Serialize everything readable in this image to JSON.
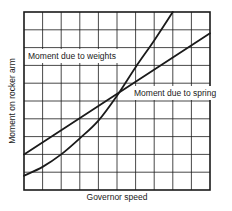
{
  "chart_data": {
    "type": "line",
    "title": "",
    "xlabel": "Governor speed",
    "ylabel": "Moment on rocker arm",
    "xlim": [
      0,
      10
    ],
    "ylim": [
      0,
      10
    ],
    "grid": true,
    "grid_divisions": {
      "x": 10,
      "y": 10
    },
    "tick_labels": false,
    "legend": "inline labels",
    "series": [
      {
        "name": "Moment due to weights",
        "shape": "curve (upward-bending)",
        "x": [
          0,
          1,
          2,
          3,
          4,
          5,
          6,
          7,
          8
        ],
        "y": [
          0.8,
          1.3,
          2.0,
          2.9,
          3.9,
          5.3,
          6.9,
          8.4,
          10.0
        ]
      },
      {
        "name": "Moment due to spring",
        "shape": "straight line",
        "x": [
          0,
          10
        ],
        "y": [
          2.0,
          8.8
        ]
      }
    ],
    "annotations": [
      {
        "text": "Moment due to weights",
        "x": 0.2,
        "y": 7.5
      },
      {
        "text": "Moment due to spring",
        "x": 5.9,
        "y": 5.4
      }
    ],
    "intersection": {
      "x": 5.0,
      "y": 5.3
    }
  },
  "labels": {
    "xlabel": "Governor speed",
    "ylabel": "Moment on rocker arm",
    "weights": "Moment due to weights",
    "spring": "Moment due to spring"
  },
  "colors": {
    "line": "#1a1a1a",
    "grid": "#1a1a1a",
    "background": "#ffffff"
  }
}
